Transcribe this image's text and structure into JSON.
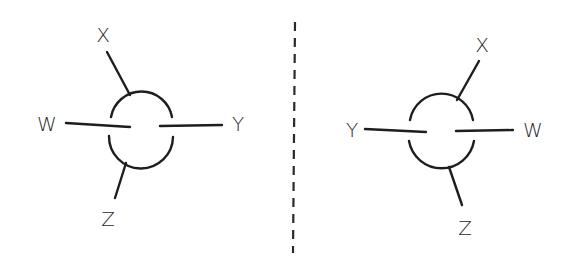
{
  "diagram": {
    "type": "newman-projection-mirror-images",
    "colors": {
      "ink": "#1e1e1e",
      "background": "#ffffff"
    },
    "left_molecule": {
      "labels": {
        "top": "X",
        "left": "W",
        "right": "Y",
        "bottom": "Z"
      }
    },
    "mirror_plane": {
      "style": "dashed"
    },
    "right_molecule": {
      "labels": {
        "top": "X",
        "left": "Y",
        "right": "W",
        "bottom": "Z"
      }
    }
  }
}
